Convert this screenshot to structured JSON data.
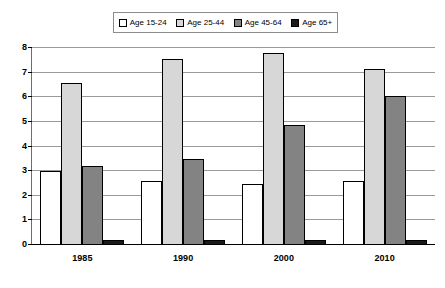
{
  "chart_data": {
    "type": "bar",
    "title": "",
    "xlabel": "",
    "ylabel": "",
    "ylim": [
      0,
      8
    ],
    "yticks": [
      "0",
      "1",
      "2",
      "3",
      "4",
      "5",
      "6",
      "7",
      "8"
    ],
    "grid": true,
    "legend_position": "top",
    "categories": [
      "1985",
      "1990",
      "2000",
      "2010"
    ],
    "series": [
      {
        "name": "Age 15-24",
        "color": "#ffffff",
        "values": [
          2.95,
          2.55,
          2.45,
          2.55
        ]
      },
      {
        "name": "Age 25-44",
        "color": "#d7d7d7",
        "values": [
          6.55,
          7.5,
          7.75,
          7.1
        ]
      },
      {
        "name": "Age 45-64",
        "color": "#838383",
        "values": [
          3.15,
          3.45,
          4.85,
          6.0
        ]
      },
      {
        "name": "Age 65+",
        "color": "#1a1a1a",
        "values": [
          0.15,
          0.15,
          0.15,
          0.15
        ]
      }
    ]
  }
}
